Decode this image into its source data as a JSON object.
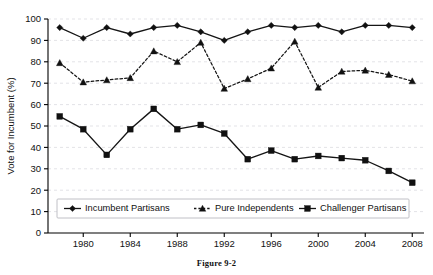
{
  "figure": {
    "caption": "Figure 9-2"
  },
  "chart_data": {
    "type": "line",
    "title": "",
    "subtitle": "",
    "xlabel": "",
    "ylabel": "Vote for Incumbent (%)",
    "x": [
      1978,
      1980,
      1982,
      1984,
      1986,
      1988,
      1990,
      1992,
      1994,
      1996,
      1998,
      2000,
      2002,
      2004,
      2006,
      2008
    ],
    "xlim": [
      1977,
      2009
    ],
    "ylim": [
      0,
      100
    ],
    "xticks": [
      1980,
      1984,
      1988,
      1992,
      1996,
      2000,
      2004,
      2008
    ],
    "xtick_labels": [
      "1980",
      "1984",
      "1988",
      "1992",
      "1996",
      "2000",
      "2004",
      "2008"
    ],
    "yticks": [
      0,
      10,
      20,
      30,
      40,
      50,
      60,
      70,
      80,
      90,
      100
    ],
    "ytick_labels": [
      "0",
      "10",
      "20",
      "30",
      "40",
      "50",
      "60",
      "70",
      "80",
      "90",
      "100"
    ],
    "grid": true,
    "grid_axis": "y",
    "legend_position": "bottom-inside",
    "series": [
      {
        "name": "Incumbent Partisans",
        "marker": "diamond",
        "linestyle": "solid",
        "color": "#111111",
        "values": [
          96,
          91,
          96,
          93,
          96,
          97,
          94,
          90,
          94,
          97,
          96,
          97,
          94,
          97,
          97,
          96
        ]
      },
      {
        "name": "Pure Independents",
        "marker": "triangle",
        "linestyle": "dotted",
        "color": "#111111",
        "values": [
          79.5,
          70.5,
          71.5,
          72.5,
          85,
          80,
          89,
          67.5,
          72,
          77,
          89.5,
          68,
          75.5,
          76,
          74,
          71
        ]
      },
      {
        "name": "Challenger Partisans",
        "marker": "square",
        "linestyle": "solid",
        "color": "#111111",
        "values": [
          54.5,
          48.5,
          36.5,
          48.5,
          58,
          48.5,
          50.5,
          46.5,
          34.5,
          38.5,
          34.5,
          36,
          35,
          34,
          29,
          23.5
        ]
      }
    ]
  }
}
